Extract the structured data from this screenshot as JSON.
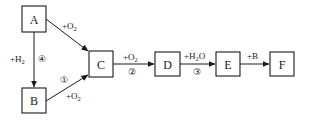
{
  "diagram": {
    "type": "reaction-flowchart",
    "nodes": [
      {
        "id": "A",
        "label": "A"
      },
      {
        "id": "B",
        "label": "B"
      },
      {
        "id": "C",
        "label": "C"
      },
      {
        "id": "D",
        "label": "D"
      },
      {
        "id": "E",
        "label": "E"
      },
      {
        "id": "F",
        "label": "F"
      }
    ],
    "edges": [
      {
        "from": "A",
        "to": "C",
        "reagent_prefix": "+O",
        "reagent_sub": "2",
        "reagent_suffix": "",
        "step": ""
      },
      {
        "from": "A",
        "to": "B",
        "reagent_prefix": "+H",
        "reagent_sub": "2",
        "reagent_suffix": "",
        "step": "④"
      },
      {
        "from": "B",
        "to": "C",
        "reagent_prefix": "+O",
        "reagent_sub": "2",
        "reagent_suffix": "",
        "step": "①"
      },
      {
        "from": "C",
        "to": "D",
        "reagent_prefix": "+O",
        "reagent_sub": "2",
        "reagent_suffix": "",
        "step": "②"
      },
      {
        "from": "D",
        "to": "E",
        "reagent_prefix": "+H",
        "reagent_sub": "2",
        "reagent_suffix": "O",
        "step": "③"
      },
      {
        "from": "E",
        "to": "F",
        "reagent_prefix": "+B",
        "reagent_sub": "",
        "reagent_suffix": "",
        "step": ""
      }
    ]
  }
}
